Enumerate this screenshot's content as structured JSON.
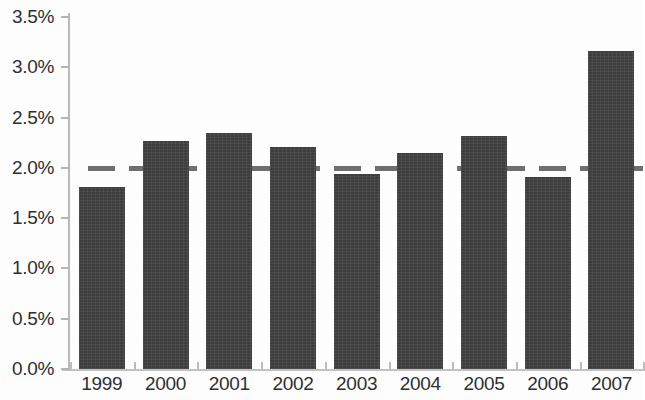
{
  "chart_data": {
    "type": "bar",
    "title": "",
    "subtitle": "",
    "xlabel": "",
    "ylabel": "",
    "categories": [
      "1999",
      "2000",
      "2001",
      "2002",
      "2003",
      "2004",
      "2005",
      "2006",
      "2007"
    ],
    "values": [
      1.81,
      2.27,
      2.35,
      2.21,
      1.94,
      2.15,
      2.32,
      1.91,
      3.16
    ],
    "value_unit": "%",
    "ylim": [
      0.0,
      3.5
    ],
    "ytick_values": [
      0.0,
      0.5,
      1.0,
      1.5,
      2.0,
      2.5,
      3.0,
      3.5
    ],
    "ytick_labels": [
      "0.0%",
      "0.5%",
      "1.0%",
      "1.5%",
      "2.0%",
      "2.5%",
      "3.0%",
      "3.5%"
    ],
    "grid": false,
    "legend": null,
    "legend_position": "none",
    "annotations": [
      {
        "name": "reference-line",
        "type": "horizontal-dashed-line",
        "value": 2.0,
        "label": "",
        "style": "dashed",
        "color": "#6f6f6f"
      }
    ],
    "series": [
      {
        "name": "annual rate",
        "color": "#3e3e3e",
        "values": [
          1.81,
          2.27,
          2.35,
          2.21,
          1.94,
          2.15,
          2.32,
          1.91,
          3.16
        ]
      }
    ]
  },
  "colors": {
    "bar_fill": "#3e3e3e",
    "reference_line": "#6f6f6f",
    "axis": "#bdbdbd",
    "text": "#2f2f2f",
    "background": "#fdfdfd"
  }
}
